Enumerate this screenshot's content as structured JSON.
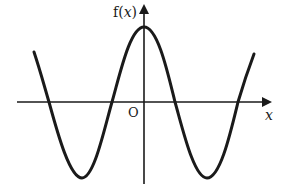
{
  "diagram": {
    "y_axis_label_prefix": "f(",
    "y_axis_label_var": "x",
    "y_axis_label_suffix": ")",
    "x_axis_label": "x",
    "origin_label": "O",
    "stroke_color": "#1a1a1a",
    "curve": "cosine-like wave, maximum on y-axis, two minima, four x-intercepts"
  }
}
